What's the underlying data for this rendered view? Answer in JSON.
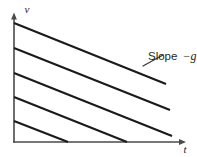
{
  "figure": {
    "kind": "line",
    "background_color": "#ffffff",
    "line_color": "#1a1a1a",
    "axis_color": "#4a4a4a",
    "axes": {
      "y_label": "v",
      "x_label": "t",
      "y_label_meaning": "velocity",
      "x_label_meaning": "time",
      "y_arrow_icon": "arrow-up-icon",
      "x_arrow_icon": "arrow-right-icon",
      "origin_x": 14,
      "origin_y": 142,
      "x_axis_end": 186,
      "y_axis_top": 14
    },
    "annotation": {
      "text": "Slope",
      "variable": "−g",
      "full": "Slope −g",
      "text_x": 148,
      "text_y": 60,
      "leader": {
        "x1": 143,
        "y1": 66,
        "x2": 163,
        "y2": 55
      }
    }
  },
  "chart_data": {
    "type": "line",
    "title": "",
    "subtitle": "",
    "xlabel": "t",
    "ylabel": "v",
    "grid": false,
    "legend": null,
    "xlim": [
      0,
      1
    ],
    "ylim": [
      0,
      1
    ],
    "axis_ticks": {
      "x": [],
      "y": []
    },
    "slope_label": "Slope −g",
    "series": [
      {
        "name": "line-1",
        "start": {
          "x": 14,
          "y": 23
        },
        "end": {
          "x": 166,
          "y": 84
        },
        "v_intercept_label": "",
        "points": [
          [
            14,
            23
          ],
          [
            166,
            84
          ]
        ]
      },
      {
        "name": "line-2",
        "start": {
          "x": 14,
          "y": 48
        },
        "end": {
          "x": 170,
          "y": 110
        },
        "v_intercept_label": "",
        "points": [
          [
            14,
            48
          ],
          [
            170,
            110
          ]
        ]
      },
      {
        "name": "line-3",
        "start": {
          "x": 14,
          "y": 73
        },
        "end": {
          "x": 172,
          "y": 136
        },
        "v_intercept_label": "",
        "points": [
          [
            14,
            73
          ],
          [
            172,
            136
          ]
        ]
      },
      {
        "name": "line-4",
        "start": {
          "x": 14,
          "y": 97
        },
        "end": {
          "x": 127,
          "y": 142
        },
        "v_intercept_label": "",
        "points": [
          [
            14,
            97
          ],
          [
            127,
            142
          ]
        ]
      },
      {
        "name": "line-5",
        "start": {
          "x": 14,
          "y": 121
        },
        "end": {
          "x": 68,
          "y": 142
        },
        "v_intercept_label": "",
        "points": [
          [
            14,
            121
          ],
          [
            68,
            142
          ]
        ]
      }
    ],
    "annotations": [
      {
        "text": "Slope −g",
        "x": 148,
        "y": 60,
        "points_to": [
          163,
          55
        ]
      }
    ]
  }
}
